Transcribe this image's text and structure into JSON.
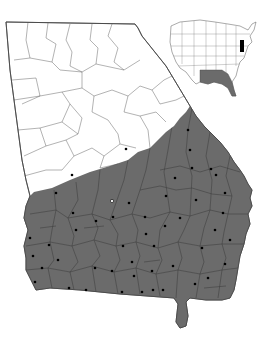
{
  "map": {
    "title": "Georgia county distribution map",
    "colors": {
      "background": "#ffffff",
      "range_fill": "#6b6b6b",
      "outline": "#444444",
      "county_line_unshaded": "#555555",
      "county_line_shaded": "#3a3a3a",
      "dot": "#000000",
      "open_dot_fill": "#ffffff"
    },
    "state_outline": "M6,22 L135,24 L138,28 L142,36 L150,46 L158,56 L166,66 L172,76 L178,86 L184,96 L190,106 L196,116 L204,126 L212,134 L220,142 L228,152 L234,162 L240,170 L244,176 L248,184 L252,190 L250,198 L252,206 L248,214 L250,224 L246,234 L244,244 L240,256 L238,268 L236,280 L234,290 L230,298 L222,300 L206,300 L190,298 L186,302 L188,316 L186,326 L180,328 L176,322 L178,304 L174,298 L120,294 L80,290 L50,288 L36,290 L32,282 L26,270 L26,258 L24,246 L28,230 L24,218 L26,206 L30,196 L26,180 L22,160 L18,130 L14,100 L10,70 Z",
    "range_outline": "M34,192 L52,188 L70,180 L90,172 L110,166 L128,160 L138,152 L150,148 L158,140 L166,132 L174,126 L180,118 L186,112 L190,106 L196,116 L204,126 L212,134 L220,142 L228,152 L234,162 L240,170 L244,176 L248,184 L252,190 L250,198 L252,206 L248,214 L250,224 L246,234 L244,244 L240,256 L238,268 L236,280 L234,290 L230,298 L222,300 L206,300 L190,298 L186,302 L188,316 L186,326 L180,328 L176,322 L178,304 L174,298 L120,294 L80,290 L50,288 L36,290 L32,282 L26,270 L26,258 L24,246 L28,230 L24,218 L26,206 L30,196 Z",
    "county_lines_unshaded": [
      "M28,22 L26,40 L30,58 L14,60",
      "M48,23 L46,38 L56,44 L52,62 L60,70",
      "M70,24 L66,40 L72,52 L70,66 L82,72",
      "M92,24 L90,40 L98,48 L96,64",
      "M112,24 L108,36 L118,48 L114,62 L124,70",
      "M12,80 L36,78 L40,96 L22,104",
      "M40,96 L62,92 L70,104 L62,122",
      "M62,92 L82,88 L94,96 L92,112",
      "M94,96 L112,90 L128,96 L124,112",
      "M128,96 L140,86 L152,90 L160,104",
      "M18,130 L40,128 L46,146 L24,156",
      "M46,146 L66,140 L74,156 L62,170",
      "M74,156 L92,148 L104,156 L100,168",
      "M104,156 L120,144 L136,148",
      "M70,104 L82,118 L78,134 L66,140",
      "M92,112 L108,120 L118,134 L120,144",
      "M124,112 L140,116 L148,130 L150,148",
      "M140,116 L156,112 L166,122",
      "M14,100 L40,96",
      "M60,70 L82,72 L96,64 L124,70 L140,60",
      "M30,58 L52,62",
      "M82,72 L82,88",
      "M40,128 L62,122 L78,134",
      "M24,176 L46,170 L62,170",
      "M100,168 L118,164",
      "M152,90 L164,80 L172,76",
      "M160,104 L176,100 L184,96"
    ],
    "county_lines_shaded": [
      "M30,214 L56,210 L68,218 L92,214 L110,220 L132,214 L150,218 L170,212 L190,216 L210,210 L228,214 L248,214",
      "M26,246 L50,242 L72,246 L94,240 L116,246 L136,242 L158,248 L178,242 L200,246 L222,244 L244,244",
      "M26,270 L48,268 L70,272 L92,266 L114,272 L136,268 L156,274 L178,270 L200,274 L222,270 L238,268",
      "M54,190 L56,210 L52,230 L50,242 L54,260 L48,268 L52,288",
      "M76,182 L78,200 L68,218 L74,236 L72,246 L78,262 L70,272 L74,290",
      "M100,170 L98,190 L92,214 L98,228 L94,240 L100,256 L92,266 L96,292",
      "M128,160 L124,180 L110,220 L118,234 L116,246 L120,260 L114,272 L118,294",
      "M150,148 L146,170 L140,190 L132,214 L138,230 L136,242 L140,256 L136,268 L140,294",
      "M172,126 L168,150 L164,172 L170,212 L160,230 L158,248 L162,260 L156,274 L160,296",
      "M192,108 L188,130 L186,152 L192,176 L190,216 L184,230 L178,242 L182,258 L178,270 L176,298",
      "M210,132 L206,156 L212,180 L210,210 L204,228 L200,246 L204,262 L200,274 L196,298",
      "M230,156 L226,176 L232,196 L228,214 L224,232 L222,244 L226,258 L222,270 L218,298",
      "M160,170 L180,166 L200,172 L220,166 L240,172",
      "M140,190 L160,186 L176,190 L192,188 L212,194 L232,196",
      "M40,228 L56,226",
      "M84,228 L104,226",
      "M144,262 L160,260",
      "M204,288 L226,286"
    ],
    "dots": [
      {
        "x": 126,
        "y": 149,
        "open": false
      },
      {
        "x": 188,
        "y": 130,
        "open": false
      },
      {
        "x": 190,
        "y": 150,
        "open": false
      },
      {
        "x": 192,
        "y": 168,
        "open": false
      },
      {
        "x": 211,
        "y": 169,
        "open": false
      },
      {
        "x": 175,
        "y": 178,
        "open": false
      },
      {
        "x": 225,
        "y": 193,
        "open": false
      },
      {
        "x": 72,
        "y": 175,
        "open": false
      },
      {
        "x": 56,
        "y": 193,
        "open": false
      },
      {
        "x": 112,
        "y": 201,
        "open": true
      },
      {
        "x": 129,
        "y": 203,
        "open": false
      },
      {
        "x": 73,
        "y": 213,
        "open": false
      },
      {
        "x": 96,
        "y": 221,
        "open": false
      },
      {
        "x": 113,
        "y": 217,
        "open": false
      },
      {
        "x": 76,
        "y": 230,
        "open": false
      },
      {
        "x": 30,
        "y": 238,
        "open": false
      },
      {
        "x": 49,
        "y": 245,
        "open": false
      },
      {
        "x": 33,
        "y": 256,
        "open": false
      },
      {
        "x": 58,
        "y": 260,
        "open": false
      },
      {
        "x": 123,
        "y": 246,
        "open": false
      },
      {
        "x": 42,
        "y": 268,
        "open": false
      },
      {
        "x": 95,
        "y": 268,
        "open": false
      },
      {
        "x": 112,
        "y": 271,
        "open": false
      },
      {
        "x": 35,
        "y": 282,
        "open": false
      },
      {
        "x": 69,
        "y": 288,
        "open": false
      },
      {
        "x": 86,
        "y": 290,
        "open": false
      },
      {
        "x": 122,
        "y": 292,
        "open": false
      },
      {
        "x": 134,
        "y": 276,
        "open": false
      },
      {
        "x": 142,
        "y": 292,
        "open": false
      },
      {
        "x": 153,
        "y": 290,
        "open": false
      },
      {
        "x": 163,
        "y": 290,
        "open": false
      },
      {
        "x": 154,
        "y": 246,
        "open": false
      },
      {
        "x": 146,
        "y": 234,
        "open": false
      },
      {
        "x": 132,
        "y": 262,
        "open": false
      },
      {
        "x": 180,
        "y": 218,
        "open": false
      },
      {
        "x": 196,
        "y": 200,
        "open": false
      },
      {
        "x": 216,
        "y": 175,
        "open": false
      },
      {
        "x": 223,
        "y": 213,
        "open": false
      },
      {
        "x": 215,
        "y": 230,
        "open": false
      },
      {
        "x": 202,
        "y": 248,
        "open": false
      },
      {
        "x": 230,
        "y": 240,
        "open": false
      },
      {
        "x": 225,
        "y": 264,
        "open": false
      },
      {
        "x": 208,
        "y": 278,
        "open": false
      },
      {
        "x": 165,
        "y": 226,
        "open": false
      },
      {
        "x": 173,
        "y": 266,
        "open": false
      },
      {
        "x": 166,
        "y": 196,
        "open": false
      },
      {
        "x": 145,
        "y": 217,
        "open": false
      },
      {
        "x": 195,
        "y": 284,
        "open": false
      },
      {
        "x": 152,
        "y": 271,
        "open": false
      }
    ],
    "inset": {
      "label": "United States locator inset",
      "outline": "M171,26 L180,22 L200,20 L215,22 L228,24 L240,26 L248,30 L252,24 L256,22 L254,30 L250,36 L252,42 L248,46 L246,52 L244,58 L240,62 L238,68 L236,76 L232,82 L234,90 L236,96 L232,96 L228,88 L222,84 L214,82 L208,84 L200,82 L196,84 L192,80 L186,72 L180,68 L176,62 L172,52 L170,42 Z",
      "shaded": "M200,70 L212,70 L222,70 L228,74 L232,82 L234,90 L236,96 L232,96 L228,88 L222,84 L214,82 L208,84 L200,82 Z",
      "highlight": "M240,40 L244,40 L244,52 L240,52 Z",
      "state_lines": [
        "M182,22 L182,64",
        "M194,21 L194,76",
        "M206,21 L206,82",
        "M216,22 L216,70",
        "M226,24 L226,74",
        "M236,26 L236,66",
        "M171,34 L250,34",
        "M171,46 L248,46",
        "M172,56 L244,56",
        "M178,66 L240,64"
      ]
    }
  }
}
